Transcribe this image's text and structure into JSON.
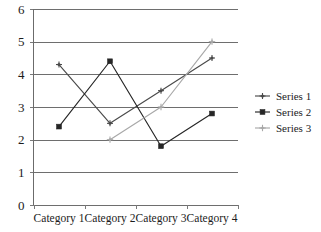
{
  "chart_data": {
    "type": "line",
    "title": "",
    "subtitle": "",
    "xlabel": "",
    "ylabel": "",
    "categories": [
      "Category 1",
      "Category 2",
      "Category 3",
      "Category 4"
    ],
    "series": [
      {
        "name": "Series 1",
        "values": [
          4.3,
          2.5,
          3.5,
          4.5
        ],
        "color": "#4a4a4a",
        "marker": "diamond"
      },
      {
        "name": "Series 2",
        "values": [
          2.4,
          4.4,
          1.8,
          2.8
        ],
        "color": "#262626",
        "marker": "square"
      },
      {
        "name": "Series 3",
        "values": [
          null,
          2.0,
          3.0,
          5.0
        ],
        "color": "#a8a8a8",
        "marker": "star"
      }
    ],
    "ylim": [
      0,
      6
    ],
    "yticks": [
      "0",
      "1",
      "2",
      "3",
      "4",
      "5",
      "6"
    ],
    "grid": true,
    "grid_axis": "y",
    "legend_position": "right",
    "legend_entries": [
      "Series 1",
      "Series 2",
      "Series 3"
    ]
  },
  "axes": {
    "y_tick_labels": [
      "6",
      "5",
      "4",
      "3",
      "2",
      "1",
      "0"
    ],
    "x_tick_labels": [
      "Category 1",
      "Category 2",
      "Category 3",
      "Category 4"
    ]
  },
  "legend": {
    "items": [
      {
        "label": "Series 1"
      },
      {
        "label": "Series 2"
      },
      {
        "label": "Series 3"
      }
    ]
  },
  "colors": {
    "series1": "#4a4a4a",
    "series2": "#262626",
    "series3": "#a8a8a8",
    "grid": "#6e6e6e",
    "axis": "#6b6b6b",
    "background": "#ffffff",
    "text": "#1c1c1c"
  }
}
